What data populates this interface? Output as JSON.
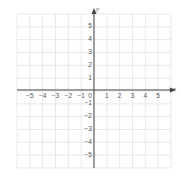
{
  "diagram": {
    "type": "coordinate-plane",
    "x_axis_label": "x",
    "y_axis_label": "y",
    "x_range": [
      -6,
      6
    ],
    "y_range": [
      -6,
      6
    ],
    "x_tick_labels": [
      "-5",
      "-4",
      "-3",
      "-2",
      "-1",
      "0",
      "1",
      "2",
      "3",
      "4",
      "5"
    ],
    "y_tick_labels_positive": [
      "1",
      "2",
      "3",
      "4",
      "5"
    ],
    "y_tick_labels_negative": [
      "-1",
      "-2",
      "-3",
      "-4",
      "-5"
    ],
    "grid_color": "#e3e3e3",
    "axis_color": "#444444",
    "label_color": "#555555"
  }
}
